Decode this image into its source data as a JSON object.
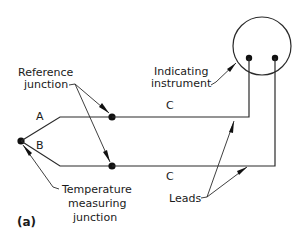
{
  "figure": {
    "panel_label": "(a)",
    "wire_labels": {
      "upper_left": "A",
      "lower_left": "B",
      "upper_right": "C",
      "lower_right": "C"
    },
    "callouts": {
      "reference_junction": [
        "Reference",
        "junction"
      ],
      "indicating_instrument": [
        "Indicating",
        "instrument"
      ],
      "temperature_junction": [
        "Temperature",
        "measuring",
        "junction"
      ],
      "leads": "Leads"
    },
    "colors": {
      "line": "#2a2a2a",
      "background": "#ffffff"
    }
  }
}
